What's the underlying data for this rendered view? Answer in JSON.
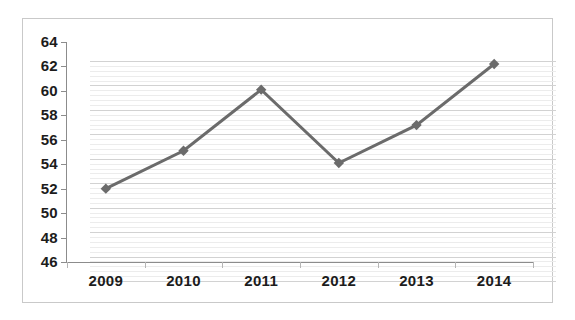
{
  "chart_data": {
    "type": "line",
    "title": "",
    "subtitle": "",
    "xlabel": "",
    "ylabel": "",
    "categories": [
      "2009",
      "2010",
      "2011",
      "2012",
      "2013",
      "2014"
    ],
    "values": [
      52.0,
      55.1,
      60.1,
      54.1,
      57.2,
      62.2
    ],
    "series": [
      {
        "name": "series-1",
        "values": [
          52.0,
          55.1,
          60.1,
          54.1,
          57.2,
          62.2
        ],
        "color": "#6b6b6b",
        "marker": "diamond",
        "line_width": 3
      }
    ],
    "ylim": [
      46,
      64
    ],
    "ytick_labels": [
      "46",
      "48",
      "50",
      "52",
      "54",
      "56",
      "58",
      "60",
      "62",
      "64"
    ],
    "ytick_values": [
      46,
      48,
      50,
      52,
      54,
      56,
      58,
      60,
      62,
      64
    ],
    "ytick_step": 2,
    "minor_grid_step": 0.4,
    "grid": true,
    "major_grid_color": "#d2d2d2",
    "minor_grid_color": "#ececec",
    "axis_color": "#8c8c8c",
    "legend": null,
    "legend_position": "none",
    "annotations": [],
    "border_color": "#c9c9c9",
    "background_color": "#ffffff",
    "label_color": "#1c1c1c"
  }
}
